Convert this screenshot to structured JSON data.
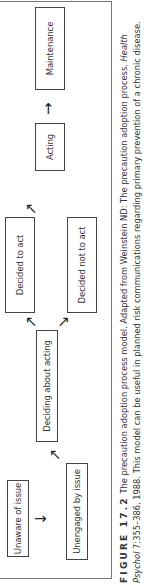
{
  "diagram": {
    "nodes": [
      {
        "id": "unaware",
        "label": "Unaware of issue"
      },
      {
        "id": "unengaged",
        "label": "Unengaged by issue"
      },
      {
        "id": "deciding",
        "label": "Deciding about acting"
      },
      {
        "id": "decided_act",
        "label": "Decided to act"
      },
      {
        "id": "decided_not",
        "label": "Decided not to act"
      },
      {
        "id": "acting",
        "label": "Acting"
      },
      {
        "id": "maintenance",
        "label": "Maintenance"
      }
    ],
    "edges": [
      {
        "from": "unaware",
        "to": "unengaged"
      },
      {
        "from": "unengaged",
        "to": "deciding"
      },
      {
        "from": "deciding",
        "to": "decided_act"
      },
      {
        "from": "deciding",
        "to": "decided_not"
      },
      {
        "from": "decided_act",
        "to": "acting"
      },
      {
        "from": "acting",
        "to": "maintenance"
      }
    ],
    "arrows": {
      "down": "↓",
      "right": "→",
      "up_right": "↗",
      "down_right": "↘"
    }
  },
  "caption": {
    "figure_label": "FIGURE 17.2",
    "text1": "The precaution adoption process model. Adapted from Weinstein ND: The precaution adoption process.",
    "journal": "Health Psychol",
    "text2": "7:355–386, 1988. This model can be useful in planned risk communications regarding primary prevention of a chronic disease."
  }
}
